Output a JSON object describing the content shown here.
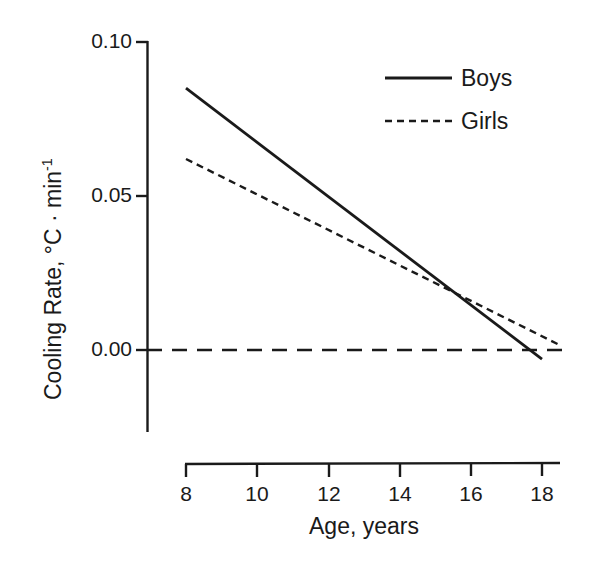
{
  "chart_data": {
    "type": "line",
    "title": "",
    "xlabel": "Age,  years",
    "ylabel_main": "Cooling Rate,",
    "ylabel_units": "°C · min",
    "ylabel_units_exponent": "-1",
    "xlim": [
      8,
      18
    ],
    "ylim": [
      0.0,
      0.1
    ],
    "x_ticks": [
      8,
      10,
      12,
      14,
      16,
      18
    ],
    "x_tick_labels": [
      "8",
      "10",
      "12",
      "14",
      "16",
      "18"
    ],
    "y_ticks": [
      0.0,
      0.05,
      0.1
    ],
    "y_tick_labels": [
      "0.00",
      "0.05",
      "0.10"
    ],
    "grid": false,
    "legend_position": "top-right",
    "series": [
      {
        "name": "Boys",
        "style": "solid",
        "color": "#1a1a1a",
        "x": [
          8,
          18
        ],
        "values": [
          0.085,
          -0.003
        ]
      },
      {
        "name": "Girls",
        "style": "dashed",
        "color": "#1a1a1a",
        "x": [
          8,
          18.5
        ],
        "values": [
          0.062,
          0.0016
        ]
      },
      {
        "name": "zero-reference",
        "style": "long-dashed",
        "color": "#1a1a1a",
        "x": [
          8,
          18.6
        ],
        "values": [
          0.0,
          0.0
        ]
      }
    ],
    "annotations": []
  },
  "legend": {
    "entries": [
      {
        "label": "Boys",
        "style": "solid"
      },
      {
        "label": "Girls",
        "style": "dashed"
      }
    ]
  },
  "axes": {
    "y_title_parts": {
      "text": "Cooling Rate,   °C · min",
      "exponent": "-1"
    },
    "x_title": "Age,  years"
  }
}
